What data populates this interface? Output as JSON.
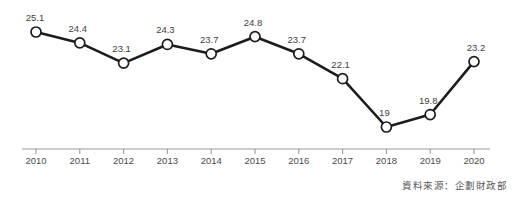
{
  "chart_data": {
    "type": "line",
    "title": "",
    "subtitle": "",
    "xlabel": "",
    "ylabel": "",
    "categories": [
      "2010",
      "2011",
      "2012",
      "2013",
      "2014",
      "2015",
      "2016",
      "2017",
      "2018",
      "2019",
      "2020"
    ],
    "values": [
      25.1,
      24.4,
      23.1,
      24.3,
      23.7,
      24.8,
      23.7,
      22.1,
      19,
      19.8,
      23.2
    ],
    "point_labels": [
      "25.1",
      "24.4",
      "23.1",
      "24.3",
      "23.7",
      "24.8",
      "23.7",
      "22.1",
      "19",
      "19.8",
      "23.2"
    ],
    "ylim": [
      18.2,
      25.8
    ],
    "grid": false,
    "legend": null,
    "annotations": {
      "source": "資料來源：企劃財政部"
    },
    "style": {
      "line_color": "#1c1c1c",
      "marker_fill": "#ffffff",
      "marker_stroke": "#1c1c1c",
      "axis_color": "#9a9a9a",
      "label_color": "#3f3f3f",
      "tick_label_color": "#4a4a4a",
      "background": "#ffffff"
    }
  },
  "source_note": "資料來源：企劃財政部"
}
